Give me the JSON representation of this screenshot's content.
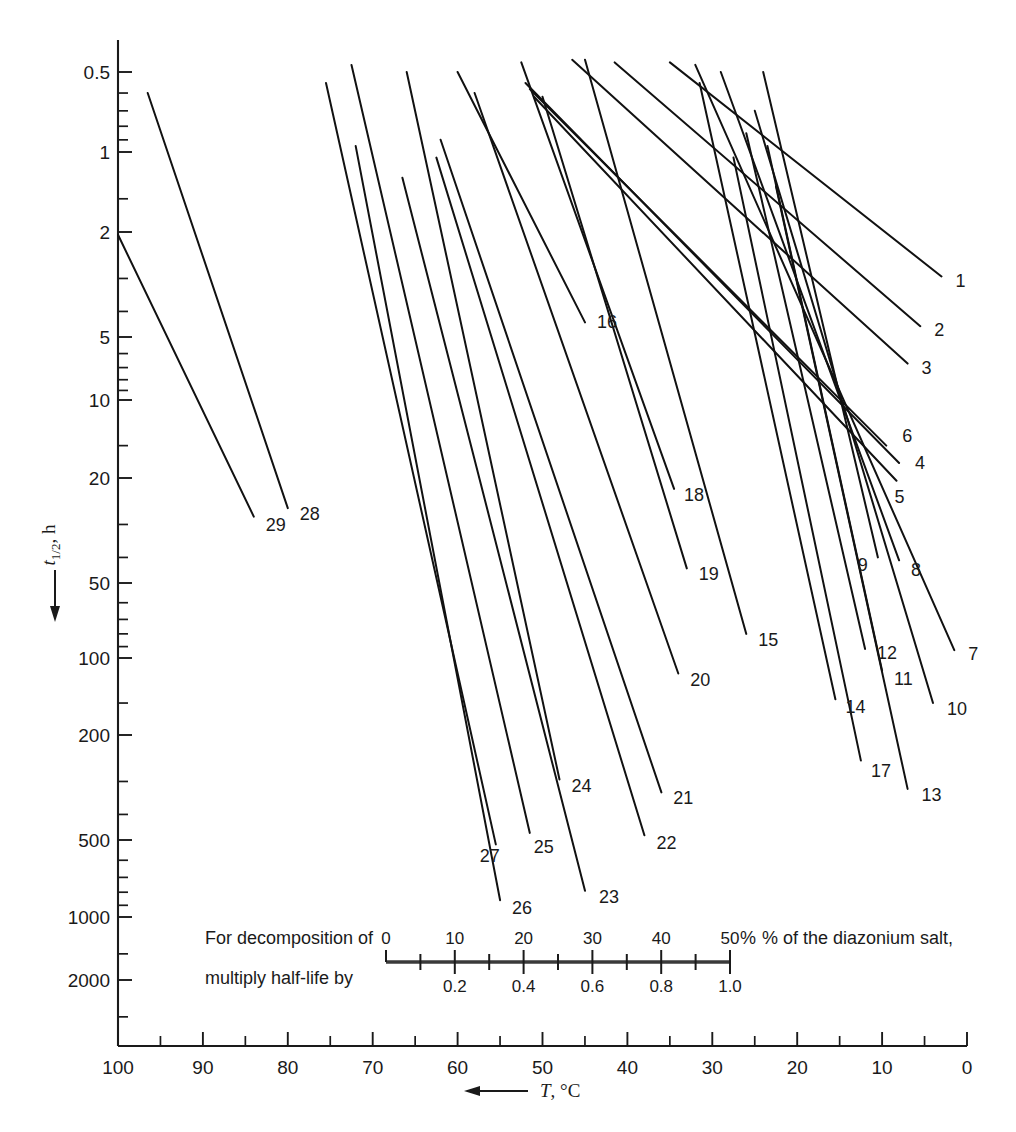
{
  "figure": {
    "background": "#ffffff",
    "ink_color": "#1a1a1a"
  },
  "chart_data": {
    "type": "line",
    "title": "",
    "xlabel": "T, °C",
    "ylabel": "t1/2, h",
    "xlabel_display": "T, °C",
    "ylabel_display_main": "t",
    "ylabel_display_sub": "1/2",
    "ylabel_display_unit": ", h",
    "x_axis": {
      "ticks": [
        100,
        90,
        80,
        70,
        60,
        50,
        40,
        30,
        20,
        10,
        0
      ],
      "min": 100,
      "max": 0,
      "direction": "decreasing-left-to-right",
      "scale": "linear",
      "arrow": "left"
    },
    "y_axis": {
      "scale": "log-reversed",
      "ticks": [
        0.5,
        1,
        2,
        5,
        10,
        20,
        50,
        100,
        200,
        500,
        1000,
        2000
      ],
      "tick_labels": [
        "0.5",
        "1",
        "2",
        "5",
        "10",
        "20",
        "50",
        "100",
        "200",
        "500",
        "1000",
        "2000"
      ],
      "direction": "increasing-downward",
      "arrow": "down"
    },
    "grid": false,
    "legend_position": "inline-labels-at-line-ends",
    "series": [
      {
        "name": "1",
        "label": "1",
        "x": [
          35.0,
          3.0
        ],
        "y": [
          0.46,
          2.95
        ]
      },
      {
        "name": "2",
        "label": "2",
        "x": [
          41.5,
          5.5
        ],
        "y": [
          0.46,
          4.55
        ]
      },
      {
        "name": "3",
        "label": "3",
        "x": [
          46.5,
          7.0
        ],
        "y": [
          0.45,
          6.7
        ]
      },
      {
        "name": "4",
        "label": "4",
        "x": [
          52.0,
          8.0
        ],
        "y": [
          0.55,
          17.5
        ]
      },
      {
        "name": "5",
        "label": "5",
        "x": [
          51.0,
          8.3
        ],
        "y": [
          0.62,
          20.5
        ]
      },
      {
        "name": "6",
        "label": "6",
        "x": [
          51.5,
          9.5
        ],
        "y": [
          0.58,
          15.0
        ]
      },
      {
        "name": "7",
        "label": "7",
        "x": [
          32.0,
          1.5
        ],
        "y": [
          0.47,
          93.0
        ]
      },
      {
        "name": "8",
        "label": "8",
        "x": [
          29.0,
          8.0
        ],
        "y": [
          0.5,
          41.0
        ]
      },
      {
        "name": "9",
        "label": "9",
        "x": [
          24.0,
          10.5
        ],
        "y": [
          0.5,
          40.0
        ]
      },
      {
        "name": "10",
        "label": "10",
        "x": [
          25.0,
          4.0
        ],
        "y": [
          0.7,
          150.0
        ]
      },
      {
        "name": "11",
        "label": "11",
        "x": [
          23.5,
          10.0
        ],
        "y": [
          0.95,
          112.0
        ]
      },
      {
        "name": "12",
        "label": "12",
        "x": [
          26.0,
          12.0
        ],
        "y": [
          0.85,
          92.0
        ]
      },
      {
        "name": "13",
        "label": "13",
        "x": [
          22.5,
          7.0
        ],
        "y": [
          1.35,
          320.0
        ]
      },
      {
        "name": "14",
        "label": "14",
        "x": [
          31.5,
          15.5
        ],
        "y": [
          0.55,
          145.0
        ]
      },
      {
        "name": "15",
        "label": "15",
        "x": [
          45.0,
          26.0
        ],
        "y": [
          0.45,
          80.0
        ]
      },
      {
        "name": "16",
        "label": "16",
        "x": [
          60.0,
          45.0
        ],
        "y": [
          0.5,
          4.4
        ]
      },
      {
        "name": "17",
        "label": "17",
        "x": [
          27.5,
          12.5
        ],
        "y": [
          1.05,
          250.0
        ]
      },
      {
        "name": "18",
        "label": "18",
        "x": [
          52.5,
          34.5
        ],
        "y": [
          0.46,
          22.0
        ]
      },
      {
        "name": "19",
        "label": "19",
        "x": [
          50.0,
          33.0
        ],
        "y": [
          0.62,
          44.0
        ]
      },
      {
        "name": "20",
        "label": "20",
        "x": [
          58.0,
          34.0
        ],
        "y": [
          0.6,
          115.0
        ]
      },
      {
        "name": "21",
        "label": "21",
        "x": [
          62.0,
          36.0
        ],
        "y": [
          0.9,
          330.0
        ]
      },
      {
        "name": "22",
        "label": "22",
        "x": [
          62.5,
          38.0
        ],
        "y": [
          1.05,
          480.0
        ]
      },
      {
        "name": "23",
        "label": "23",
        "x": [
          66.5,
          45.0
        ],
        "y": [
          1.25,
          790.0
        ]
      },
      {
        "name": "24",
        "label": "24",
        "x": [
          66.0,
          48.0
        ],
        "y": [
          0.5,
          295.0
        ]
      },
      {
        "name": "25",
        "label": "25",
        "x": [
          72.5,
          51.5
        ],
        "y": [
          0.47,
          470.0
        ]
      },
      {
        "name": "26",
        "label": "26",
        "x": [
          72.0,
          55.0
        ],
        "y": [
          0.95,
          860.0
        ]
      },
      {
        "name": "27",
        "label": "27",
        "x": [
          75.5,
          55.5
        ],
        "y": [
          0.55,
          520.0
        ]
      },
      {
        "name": "28",
        "label": "28",
        "x": [
          96.5,
          80.0
        ],
        "y": [
          0.6,
          26.0
        ]
      },
      {
        "name": "29",
        "label": "29",
        "x": [
          100.0,
          84.0
        ],
        "y": [
          2.05,
          28.0
        ]
      }
    ]
  },
  "legend_inset": {
    "line1_text": "For decomposition of",
    "line2_text": "multiply half-life by",
    "tail_text": "% of the diazonium salt,",
    "percent_scale": {
      "values": [
        0,
        10,
        20,
        30,
        40,
        50
      ],
      "labels": [
        "0",
        "10",
        "20",
        "30",
        "40",
        "50"
      ],
      "unit": "%"
    },
    "multiplier_scale": {
      "values": [
        0.2,
        0.4,
        0.6,
        0.8,
        1.0
      ],
      "labels": [
        "0.2",
        "0.4",
        "0.6",
        "0.8",
        "1.0"
      ]
    }
  }
}
